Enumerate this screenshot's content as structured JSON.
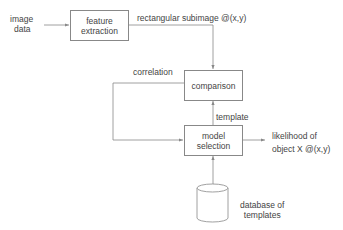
{
  "diagram": {
    "inputs": {
      "image_data_line1": "image",
      "image_data_line2": "data"
    },
    "boxes": {
      "feature_extraction": {
        "line1": "feature",
        "line2": "extraction"
      },
      "comparison": {
        "label": "comparison"
      },
      "model_selection": {
        "line1": "model",
        "line2": "selection"
      }
    },
    "database": {
      "line1": "database of",
      "line2": "templates"
    },
    "edge_labels": {
      "subimage": "rectangular subimage @(x,y)",
      "correlation": "correlation",
      "template": "template",
      "output_line1": "likelihood of",
      "output_line2": "object  X @(x,y)"
    },
    "colors": {
      "line": "#888888",
      "text": "#444444"
    }
  }
}
